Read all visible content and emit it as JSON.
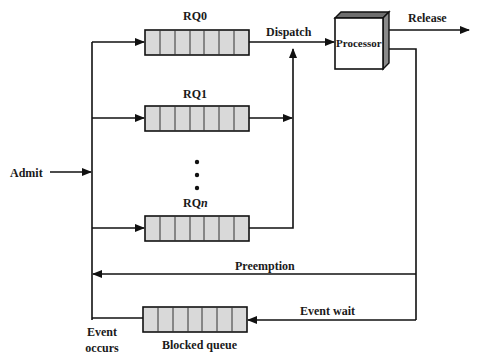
{
  "diagram": {
    "type": "process-scheduling-queue-diagram",
    "labels": {
      "admit": "Admit",
      "rq0": "RQ0",
      "rq1": "RQ1",
      "rqn_prefix": "RQ",
      "rqn_suffix": "n",
      "dispatch": "Dispatch",
      "processor": "Processor",
      "release": "Release",
      "preemption": "Preemption",
      "event_wait": "Event wait",
      "event_occurs_line1": "Event",
      "event_occurs_line2": "occurs",
      "blocked_queue": "Blocked queue"
    },
    "ellipsis": "•",
    "queues": [
      {
        "name": "RQ0",
        "slots": 7
      },
      {
        "name": "RQ1",
        "slots": 7
      },
      {
        "name": "RQn",
        "slots": 7
      },
      {
        "name": "Blocked queue",
        "slots": 7
      }
    ],
    "colors": {
      "line": "#111111",
      "queue_fill": "#d9d9d9",
      "processor_front": "#ffffff",
      "processor_side": "#8a8a8a",
      "processor_top": "#6e6e6e"
    }
  }
}
